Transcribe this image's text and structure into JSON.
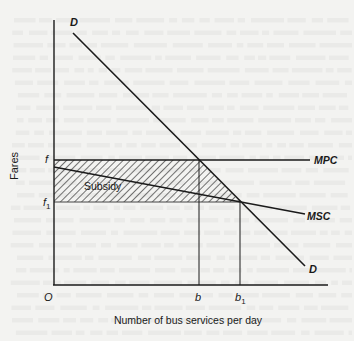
{
  "diagram": {
    "type": "economics-subsidy-diagram",
    "y_axis_label": "Fares",
    "x_axis_label": "Number of bus services per day",
    "origin_label": "O",
    "price_levels": [
      {
        "id": "f",
        "label": "f",
        "subscript": ""
      },
      {
        "id": "f1",
        "label": "f",
        "subscript": "1"
      }
    ],
    "quantity_levels": [
      {
        "id": "b",
        "label": "b",
        "subscript": ""
      },
      {
        "id": "b1",
        "label": "b",
        "subscript": "1"
      }
    ],
    "curves": [
      {
        "id": "demand",
        "label_start": "D",
        "label_end": "D",
        "description": "Demand curve, downward sloping"
      },
      {
        "id": "mpc",
        "label": "MPC",
        "description": "Marginal private cost, horizontal at fare f"
      },
      {
        "id": "msc",
        "label": "MSC",
        "description": "Marginal social cost, gently downward sloping, crosses D at b1 / f1"
      }
    ],
    "shaded_area": {
      "label": "Subsidy",
      "pattern": "diagonal-hatch",
      "bounds": "between f and f1, from vertical axis to demand curve"
    },
    "colors": {
      "ink": "#1a1a1a",
      "paper": "#f3f3f1"
    }
  }
}
